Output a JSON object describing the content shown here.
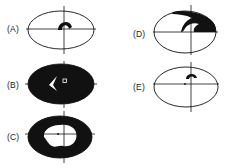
{
  "figure": {
    "panels": [
      {
        "id": "A",
        "label": "(A)",
        "field_defect": "small dense arcuate scotoma just above fixation"
      },
      {
        "id": "B",
        "label": "(B)",
        "field_defect": "near-total field loss with small central/temporal islands of vision"
      },
      {
        "id": "C",
        "label": "(C)",
        "field_defect": "peripheral ring loss with preserved central island"
      },
      {
        "id": "D",
        "label": "(D)",
        "field_defect": "superior nasal/arcuate defect extending to periphery"
      },
      {
        "id": "E",
        "label": "(E)",
        "field_defect": "small paracentral scotoma above fixation"
      }
    ],
    "colors": {
      "ink": "#111111",
      "background": "#ffffff",
      "label": "#222222"
    }
  }
}
